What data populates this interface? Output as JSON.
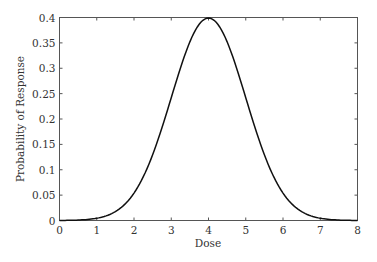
{
  "chart_data": {
    "type": "line",
    "title": "",
    "xlabel": "Dose",
    "ylabel": "Probability of Response",
    "xlim": [
      0,
      8
    ],
    "ylim": [
      0,
      0.4
    ],
    "xticks": [
      "0",
      "1",
      "2",
      "3",
      "4",
      "5",
      "6",
      "7",
      "8"
    ],
    "yticks": [
      "0",
      "0.05",
      "0.1",
      "0.15",
      "0.2",
      "0.25",
      "0.3",
      "0.35",
      "0.4"
    ],
    "grid": false,
    "legend": null,
    "series": [
      {
        "name": "Normal density (mean 4, sd 1)",
        "x": [
          0,
          0.5,
          1,
          1.5,
          2,
          2.5,
          3,
          3.5,
          4,
          4.5,
          5,
          5.5,
          6,
          6.5,
          7,
          7.5,
          8
        ],
        "values": [
          0.0001,
          0.0009,
          0.0044,
          0.0175,
          0.054,
          0.1295,
          0.242,
          0.3521,
          0.3989,
          0.3521,
          0.242,
          0.1295,
          0.054,
          0.0175,
          0.0044,
          0.0009,
          0.0001
        ]
      }
    ]
  }
}
